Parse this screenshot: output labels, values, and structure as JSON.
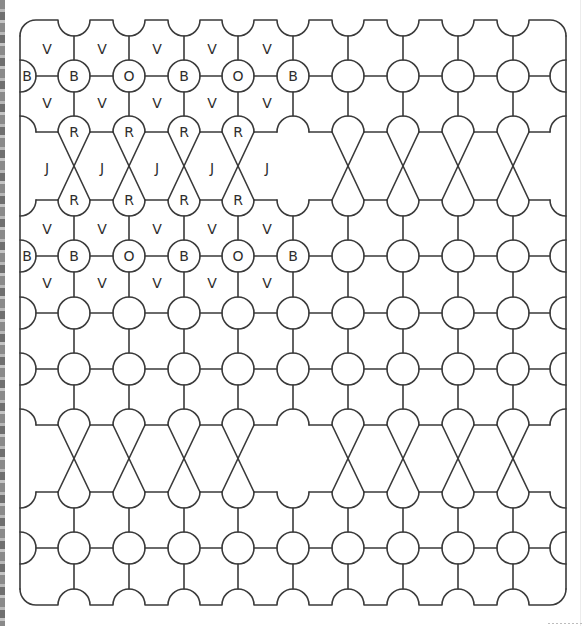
{
  "diagram": {
    "title": "",
    "stroke_color": "#3a3a3a",
    "background": "#ffffff",
    "border": {
      "left": 20,
      "right": 566,
      "top": 20,
      "bottom": 605
    },
    "radius": 16,
    "columns": [
      20,
      74,
      129,
      184,
      238,
      293,
      348,
      403,
      458,
      513,
      566
    ],
    "circle_rows": [
      76,
      256,
      313,
      369,
      548
    ],
    "twist_bands": [
      {
        "top": 132,
        "bottom": 200,
        "plain_column_index": 5
      },
      {
        "top": 425,
        "bottom": 492,
        "plain_column_index": 5
      }
    ],
    "labels": {
      "circles": [
        {
          "row": 76,
          "items": [
            "B",
            "B",
            "O",
            "B",
            "O",
            "B"
          ]
        },
        {
          "row": 256,
          "items": [
            "B",
            "B",
            "O",
            "B",
            "O",
            "B"
          ]
        }
      ],
      "teardrops": [
        {
          "row": 132,
          "items": [
            "R",
            "R",
            "R",
            "R"
          ]
        },
        {
          "row": 200,
          "items": [
            "R",
            "R",
            "R",
            "R"
          ]
        }
      ],
      "cells": [
        {
          "y": 49,
          "x": [
            47,
            102,
            157,
            212,
            267
          ],
          "text": "V"
        },
        {
          "y": 103,
          "x": [
            47,
            102,
            157,
            212,
            267
          ],
          "text": "V"
        },
        {
          "y": 168,
          "x": [
            47,
            102,
            157,
            212,
            267
          ],
          "text": "J"
        },
        {
          "y": 229,
          "x": [
            47,
            102,
            157,
            212,
            267
          ],
          "text": "V"
        },
        {
          "y": 283,
          "x": [
            47,
            102,
            157,
            212,
            267
          ],
          "text": "V"
        }
      ]
    },
    "legend_letters": [
      "B",
      "O",
      "V",
      "R",
      "J"
    ]
  }
}
